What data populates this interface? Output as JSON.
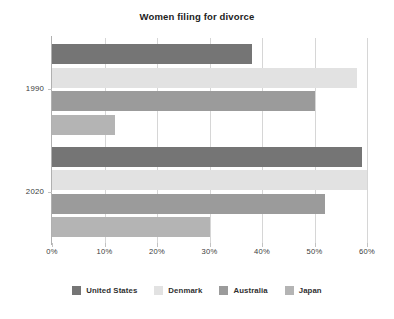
{
  "chart_data": {
    "type": "bar",
    "orientation": "horizontal",
    "title": "Women filing for divorce",
    "xlabel": "",
    "ylabel": "",
    "categories": [
      "1990",
      "2020"
    ],
    "xlim": [
      0,
      60
    ],
    "xticks": [
      0,
      10,
      20,
      30,
      40,
      50,
      60
    ],
    "xtick_labels": [
      "0%",
      "10%",
      "20%",
      "30%",
      "40%",
      "50%",
      "60%"
    ],
    "grid": true,
    "legend_position": "bottom",
    "series": [
      {
        "name": "United States",
        "color": "#757575",
        "values": [
          38,
          59
        ]
      },
      {
        "name": "Denmark",
        "color": "#e2e2e2",
        "values": [
          58,
          60
        ]
      },
      {
        "name": "Australia",
        "color": "#9b9b9b",
        "values": [
          50,
          52
        ]
      },
      {
        "name": "Japan",
        "color": "#b4b4b4",
        "values": [
          12,
          30
        ]
      }
    ]
  },
  "axis": {
    "tick_color": "#c2c2c2",
    "grid_color": "#d6d6d6",
    "line_color": "#b0b0b0"
  }
}
